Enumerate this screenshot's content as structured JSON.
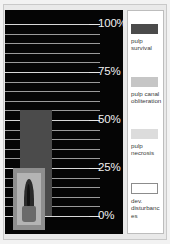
{
  "chart_data": {
    "type": "bar",
    "title": "",
    "subtitle": "",
    "xlabel": "",
    "ylabel": "",
    "ylim": [
      0,
      100
    ],
    "grid": true,
    "legend_position": "right",
    "categories": [
      "tooth"
    ],
    "axis_ticks": [
      {
        "value": 100,
        "label": "100%"
      },
      {
        "value": 75,
        "label": "75%"
      },
      {
        "value": 50,
        "label": "50%"
      },
      {
        "value": 25,
        "label": "25%"
      },
      {
        "value": 0,
        "label": "0%"
      }
    ],
    "series": [
      {
        "name": "pulp survival",
        "color": "#4b4b4b",
        "values": [
          55
        ]
      },
      {
        "name": "pulp canal obliteration",
        "color": "#c6c6c6",
        "values": [
          0
        ]
      },
      {
        "name": "pulp necrosis",
        "color": "#dcdcdc",
        "values": [
          0
        ]
      },
      {
        "name": "dev. disturbances",
        "color": "#ffffff",
        "values": [
          0
        ]
      }
    ]
  },
  "plot": {
    "bar_label": "pulp survival bar",
    "thumbnail_name": "tooth radiograph"
  },
  "legend": {
    "items": [
      {
        "label": "pulp survival",
        "color": "#4b4b4b"
      },
      {
        "label": "pulp canal obliteration",
        "color": "#c6c6c6"
      },
      {
        "label": "pulp necrosis",
        "color": "#dcdcdc"
      },
      {
        "label": "dev. disturbances",
        "color": "#ffffff"
      }
    ]
  }
}
